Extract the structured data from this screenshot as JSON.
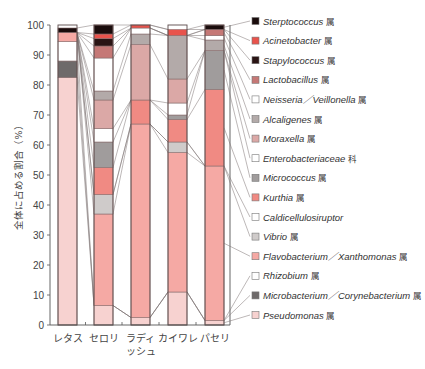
{
  "chart_data": {
    "type": "bar",
    "stacked": true,
    "title": "",
    "xlabel": "",
    "ylabel": "全体に占める割合（%）",
    "ylim": [
      0,
      100
    ],
    "yticks": [
      0,
      10,
      20,
      30,
      40,
      50,
      60,
      70,
      80,
      90,
      100
    ],
    "grid": false,
    "legend_position": "right",
    "categories": [
      "レタス",
      "セロリ",
      "ラディッシュ",
      "カイワレ",
      "パセリ"
    ],
    "category_display": [
      [
        "レタス"
      ],
      [
        "セロリ"
      ],
      [
        "ラディ",
        "ッシュ"
      ],
      [
        "カイワレ"
      ],
      [
        "パセリ"
      ]
    ],
    "series": [
      {
        "name": "Pseudomonas",
        "suffix": "属",
        "color": "#f7d2d0",
        "values": [
          82.5,
          6.5,
          2.5,
          11,
          1.5
        ]
      },
      {
        "name": "Microbacterium／Corynebacterium",
        "suffix": "属",
        "color": "#6e6a6a",
        "values": [
          5.5,
          0,
          0,
          0,
          0
        ]
      },
      {
        "name": "Rhizobium",
        "suffix": "属",
        "color": "#ffffff",
        "values": [
          6.5,
          0,
          0,
          0,
          0
        ]
      },
      {
        "name": "Flavobacterium／Xanthomonas",
        "suffix": "属",
        "color": "#f5a9a4",
        "values": [
          3,
          30.5,
          64.5,
          46.5,
          51.5
        ]
      },
      {
        "name": "Vibrio",
        "suffix": "属",
        "color": "#cfcbca",
        "values": [
          0,
          6.5,
          0,
          3.5,
          0
        ]
      },
      {
        "name": "Caldicellulosiruptor",
        "suffix": "",
        "color": "#ffffff",
        "values": [
          0,
          0,
          0,
          0,
          0
        ]
      },
      {
        "name": "Kurthia",
        "suffix": "属",
        "color": "#f08a83",
        "values": [
          0,
          9,
          8,
          7.5,
          25.5
        ]
      },
      {
        "name": "Micrococcus",
        "suffix": "属",
        "color": "#a09c9c",
        "values": [
          0,
          8.5,
          0,
          1.5,
          13
        ]
      },
      {
        "name": "Enterobacteriaceae",
        "suffix": "科",
        "color": "#ffffff",
        "values": [
          0,
          4.5,
          0,
          4,
          0
        ]
      },
      {
        "name": "Moraxella",
        "suffix": "属",
        "color": "#dba8a6",
        "values": [
          0,
          9.5,
          18.5,
          8,
          0
        ]
      },
      {
        "name": "Alcaligenes",
        "suffix": "属",
        "color": "#b3aaa9",
        "values": [
          0,
          3,
          3.5,
          14.5,
          3.5
        ]
      },
      {
        "name": "Neisseria／Veillonella",
        "suffix": "属",
        "color": "#ffffff",
        "values": [
          0,
          11,
          2,
          0,
          1.5
        ]
      },
      {
        "name": "Lactobacillus",
        "suffix": "属",
        "color": "#c57876",
        "values": [
          0,
          4,
          0,
          0,
          2
        ]
      },
      {
        "name": "Stapylococcus",
        "suffix": "属",
        "color": "#2a1414",
        "values": [
          0,
          2.5,
          0,
          0,
          0
        ]
      },
      {
        "name": "Acinetobacter",
        "suffix": "属",
        "color": "#e8534c",
        "values": [
          0,
          1.5,
          1,
          2,
          0
        ]
      },
      {
        "name": "Sterptococcus",
        "suffix": "属",
        "color": "#1a0c0c",
        "values": [
          1.5,
          3,
          0,
          0,
          1.5
        ]
      }
    ],
    "legend_order": [
      "Sterptococcus",
      "Acinetobacter",
      "Stapylococcus",
      "Lactobacillus",
      "Neisseria／Veillonella",
      "Alcaligenes",
      "Moraxella",
      "Enterobacteriaceae",
      "Micrococcus",
      "Kurthia",
      "Caldicellulosiruptor",
      "Vibrio",
      "Flavobacterium／Xanthomonas",
      "Rhizobium",
      "Microbacterium／Corynebacterium",
      "Pseudomonas"
    ]
  },
  "legend": [
    {
      "label": "Sterptococcus",
      "suffix": " 属",
      "color": "#1a0c0c"
    },
    {
      "label": "Acinetobacter",
      "suffix": " 属",
      "color": "#e8534c"
    },
    {
      "label": "Stapylococcus",
      "suffix": " 属",
      "color": "#2a1414"
    },
    {
      "label": "Lactobacillus",
      "suffix": " 属",
      "color": "#c57876"
    },
    {
      "label": "Neisseria／Veillonella",
      "suffix": " 属",
      "color": "#ffffff"
    },
    {
      "label": "Alcaligenes",
      "suffix": " 属",
      "color": "#b3aaa9"
    },
    {
      "label": "Moraxella",
      "suffix": " 属",
      "color": "#dba8a6"
    },
    {
      "label": "Enterobacteriaceae",
      "suffix": " 科",
      "color": "#ffffff"
    },
    {
      "label": "Micrococcus",
      "suffix": " 属",
      "color": "#a09c9c"
    },
    {
      "label": "Kurthia",
      "suffix": " 属",
      "color": "#f08a83"
    },
    {
      "label": "Caldicellulosiruptor",
      "suffix": "",
      "color": "#ffffff"
    },
    {
      "label": "Vibrio",
      "suffix": " 属",
      "color": "#cfcbca"
    },
    {
      "label": "Flavobacterium／Xanthomonas",
      "suffix": " 属",
      "color": "#f5a9a4"
    },
    {
      "label": "Rhizobium",
      "suffix": " 属",
      "color": "#ffffff"
    },
    {
      "label": "Microbacterium／Corynebacterium",
      "suffix": " 属",
      "color": "#6e6a6a"
    },
    {
      "label": "Pseudomonas",
      "suffix": " 属",
      "color": "#f7d2d0"
    }
  ],
  "axis": {
    "ylabel": "全体に占める割合（%）",
    "yticks": [
      "0",
      "10",
      "20",
      "30",
      "40",
      "50",
      "60",
      "70",
      "80",
      "90",
      "100"
    ]
  }
}
